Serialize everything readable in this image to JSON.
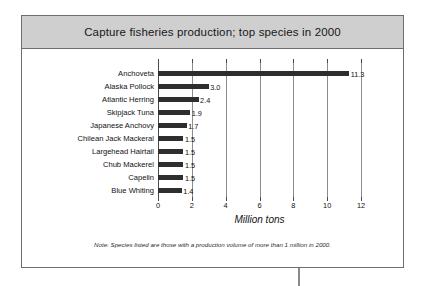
{
  "header": {
    "title": "Capture fisheries production; top species in 2000"
  },
  "footnote": "Note: Species listed are those with a production volume of more than 1 million in 2000.",
  "colors": {
    "bar": "#2e2e2e",
    "header_band": "#cfcfcf",
    "frame_border": "#6e6e6e",
    "gridline": "#8d8d8d",
    "text": "#111111"
  },
  "chart_data": {
    "type": "bar",
    "orientation": "horizontal",
    "title": "Capture fisheries production; top species in 2000",
    "xlabel": "Million tons",
    "ylabel": "",
    "xlim": [
      0,
      12
    ],
    "xticks": [
      0,
      2,
      4,
      6,
      8,
      10,
      12
    ],
    "xtick_labels": [
      "0",
      "2",
      "4",
      "6",
      "8",
      "10",
      "12"
    ],
    "grid": true,
    "legend": false,
    "categories": [
      "Anchoveta",
      "Alaska Pollock",
      "Atlantic Herring",
      "Skipjack Tuna",
      "Japanese Anchovy",
      "Chilean Jack Mackeral",
      "Largehead Hairtail",
      "Chub Mackerel",
      "Capelin",
      "Blue Whiting"
    ],
    "values": [
      11.3,
      3.0,
      2.4,
      1.9,
      1.7,
      1.5,
      1.5,
      1.5,
      1.5,
      1.4
    ],
    "data_labels": [
      "11.3",
      "3.0",
      "2.4",
      "1.9",
      "1.7",
      "1.5",
      "1.5",
      "1.5",
      "1.5",
      "1.4"
    ],
    "annotations": [
      "Note: Species listed are those with a production volume of more than 1 million in 2000."
    ]
  }
}
